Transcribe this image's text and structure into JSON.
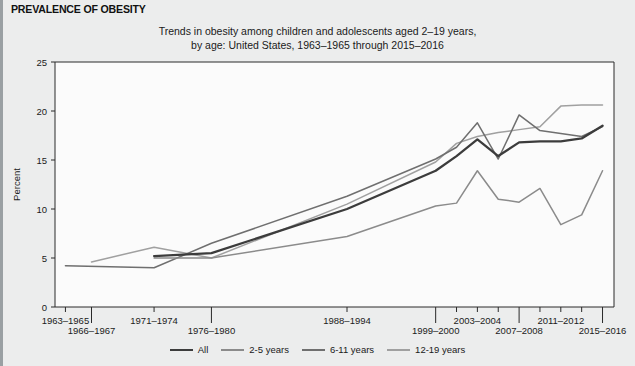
{
  "header": {
    "label": "PREVALENCE OF OBESITY"
  },
  "title": {
    "line1": "Trends in obesity among children and adolescents aged 2–19 years,",
    "line2": "by age: United States, 1963–1965 through 2015–2016"
  },
  "axes": {
    "ylabel": "Percent",
    "yticks": [
      "0",
      "5",
      "10",
      "15",
      "20",
      "25"
    ],
    "xticks_upper": [
      "1963–1965",
      "1971–1974",
      "1988–1994",
      "2003–2004",
      "2011–2012"
    ],
    "xticks_lower": [
      "1966–1967",
      "1976–1980",
      "1999–2000",
      "2007–2008",
      "2015–2016"
    ]
  },
  "legend": {
    "position": "bottom",
    "items": [
      {
        "label": "All",
        "color": "#3c3c3c",
        "width": 2.3
      },
      {
        "label": "2-5 years",
        "color": "#8b8b8b",
        "width": 1.5
      },
      {
        "label": "6-11 years",
        "color": "#6f6f6f",
        "width": 1.5
      },
      {
        "label": "12-19 years",
        "color": "#a0a0a0",
        "width": 1.5
      }
    ]
  },
  "chart_data": {
    "type": "line",
    "title": "Trends in obesity among children and adolescents aged 2–19 years, by age: United States, 1963–1965 through 2015–2016",
    "xlabel": "",
    "ylabel": "Percent",
    "ylim": [
      0,
      25
    ],
    "grid": false,
    "categories": [
      "1963–1965",
      "1966–1967",
      "1971–1974",
      "1976–1980",
      "1988–1994",
      "1999–2000",
      "2001–2002",
      "2003–2004",
      "2005–2006",
      "2007–2008",
      "2009–2010",
      "2011–2012",
      "2013–2014",
      "2015–2016"
    ],
    "x_positions": [
      1964,
      1966.5,
      1972.5,
      1978,
      1991,
      1999.5,
      2001.5,
      2003.5,
      2005.5,
      2007.5,
      2009.5,
      2011.5,
      2013.5,
      2015.5
    ],
    "series": [
      {
        "name": "All",
        "color": "#3c3c3c",
        "x": [
          1972.5,
          1978,
          1991,
          1999.5,
          2001.5,
          2003.5,
          2005.5,
          2007.5,
          2009.5,
          2011.5,
          2013.5,
          2015.5
        ],
        "values": [
          5.2,
          5.5,
          10.0,
          13.9,
          15.4,
          17.1,
          15.4,
          16.8,
          16.9,
          16.9,
          17.2,
          18.5
        ]
      },
      {
        "name": "2-5 years",
        "color": "#8b8b8b",
        "x": [
          1972.5,
          1978,
          1991,
          1999.5,
          2001.5,
          2003.5,
          2005.5,
          2007.5,
          2009.5,
          2011.5,
          2013.5,
          2015.5
        ],
        "values": [
          5.0,
          5.0,
          7.2,
          10.3,
          10.6,
          13.9,
          11.0,
          10.7,
          12.1,
          8.4,
          9.4,
          13.9
        ]
      },
      {
        "name": "6-11 years",
        "color": "#6f6f6f",
        "x": [
          1964,
          1972.5,
          1978,
          1991,
          1999.5,
          2001.5,
          2003.5,
          2005.5,
          2007.5,
          2009.5,
          2011.5,
          2013.5,
          2015.5
        ],
        "values": [
          4.2,
          4.0,
          6.5,
          11.3,
          15.1,
          16.3,
          18.8,
          15.1,
          19.6,
          18.0,
          17.7,
          17.4,
          18.4
        ]
      },
      {
        "name": "12-19 years",
        "color": "#a0a0a0",
        "x": [
          1966.5,
          1972.5,
          1978,
          1991,
          1999.5,
          2001.5,
          2003.5,
          2005.5,
          2007.5,
          2009.5,
          2011.5,
          2013.5,
          2015.5
        ],
        "values": [
          4.6,
          6.1,
          5.0,
          10.5,
          14.8,
          16.7,
          17.4,
          17.8,
          18.1,
          18.4,
          20.5,
          20.6,
          20.6
        ]
      }
    ]
  }
}
